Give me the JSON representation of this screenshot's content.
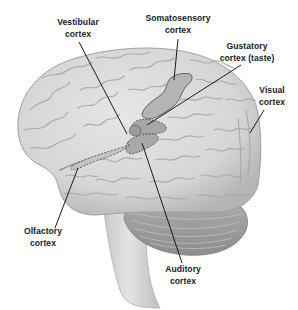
{
  "figure": {
    "labels": [
      {
        "id": "vestibular",
        "line1": "Vestibular",
        "line2": "cortex"
      },
      {
        "id": "somatosensory",
        "line1": "Somatosensory",
        "line2": "cortex"
      },
      {
        "id": "gustatory",
        "line1": "Gustatory",
        "line2": "cortex (taste)"
      },
      {
        "id": "visual",
        "line1": "Visual",
        "line2": "cortex"
      },
      {
        "id": "olfactory",
        "line1": "Olfactory",
        "line2": "cortex"
      },
      {
        "id": "auditory",
        "line1": "Auditory",
        "line2": "cortex"
      }
    ],
    "colors": {
      "background": "#ffffff",
      "brain_fill": "#dcdcdc",
      "brain_shadow": "#b9b9b9",
      "gyri_line": "#a8a8a8",
      "region_fill": "#b3b3b3",
      "region_outline": "#555555",
      "leader_line": "#1b1b1b",
      "text": "#1b1b1b"
    }
  }
}
